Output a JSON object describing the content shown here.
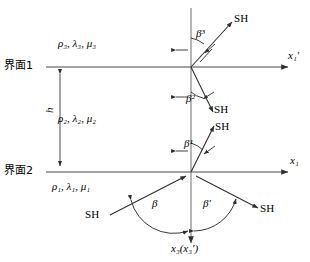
{
  "figure": {
    "type": "wave-propagation-diagram",
    "background_color": "#ffffff",
    "line_color": "#3f3f3f",
    "text_color": "#000000"
  },
  "interfaces": [
    {
      "id": "interface-1",
      "label": "界面1",
      "y": 67
    },
    {
      "id": "interface-2",
      "label": "界面2",
      "y": 172
    }
  ],
  "layers": [
    {
      "id": "layer-3",
      "label": "ρ₃, λ₃, μ₃",
      "density": "ρ₃",
      "lame_lambda": "λ₃",
      "lame_mu": "μ₃",
      "position": "above-interface-1"
    },
    {
      "id": "layer-2",
      "label": "ρ₂, λ₂, μ₂",
      "density": "ρ₂",
      "lame_lambda": "λ₂",
      "lame_mu": "μ₂",
      "position": "between-interfaces"
    },
    {
      "id": "layer-1",
      "label": "ρ₁, λ₁, μ₁",
      "density": "ρ₁",
      "lame_lambda": "λ₁",
      "lame_mu": "μ₁",
      "position": "below-interface-2"
    }
  ],
  "thickness": {
    "symbol": "h",
    "label": "h",
    "from_interface": "界面1",
    "to_interface": "界面2"
  },
  "axes": [
    {
      "id": "x1-prime-axis",
      "label": "x₁′",
      "base": "x",
      "sub": "1",
      "prime": "′",
      "direction": "right",
      "at_interface": "界面1"
    },
    {
      "id": "x1-axis",
      "label": "x₁",
      "base": "x",
      "sub": "1",
      "prime": "",
      "direction": "right",
      "at_interface": "界面2"
    },
    {
      "id": "x3-axis",
      "label": "x₃(x₃′)",
      "base": "x",
      "sub": "3",
      "prime": "",
      "direction": "down",
      "note": "x₃(x₃′)"
    }
  ],
  "angles": [
    {
      "id": "beta-3",
      "label": "β³",
      "base": "β",
      "sup": "3",
      "location": "above-interface-1"
    },
    {
      "id": "beta-2",
      "label": "β²",
      "base": "β",
      "sup": "2",
      "location": "below-interface-1"
    },
    {
      "id": "beta-1",
      "label": "β¹",
      "base": "β",
      "sup": "1",
      "location": "above-interface-2"
    },
    {
      "id": "beta-incident",
      "label": "β",
      "base": "β",
      "sup": "",
      "location": "below-interface-2-left"
    },
    {
      "id": "beta-reflected",
      "label": "β′",
      "base": "β",
      "sup": "′",
      "location": "below-interface-2-right"
    }
  ],
  "waves": [
    {
      "id": "sh-transmitted-top",
      "label": "SH",
      "location": "top-right",
      "direction": "up-right"
    },
    {
      "id": "sh-layer2-down",
      "label": "SH",
      "location": "mid-right-upper",
      "direction": "down-right"
    },
    {
      "id": "sh-layer2-up",
      "label": "SH",
      "location": "mid-right-lower",
      "direction": "up-right"
    },
    {
      "id": "sh-incident",
      "label": "SH",
      "location": "bottom-left",
      "direction": "up-right"
    },
    {
      "id": "sh-reflected",
      "label": "SH",
      "location": "bottom-right",
      "direction": "down-right"
    }
  ]
}
